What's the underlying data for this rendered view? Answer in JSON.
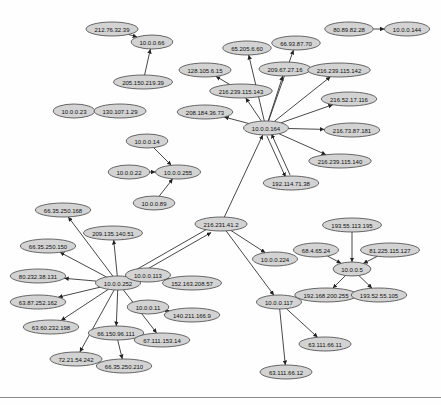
{
  "diagram": {
    "type": "directed-network-graph",
    "node_fill": "#d3d3d3",
    "node_stroke": "#444444",
    "edge_color": "#333333",
    "nodes": [
      {
        "id": "n1",
        "label": "212.76.32.39",
        "x": 112,
        "y": 29
      },
      {
        "id": "n2",
        "label": "10.0.0.66",
        "x": 152,
        "y": 42
      },
      {
        "id": "n3",
        "label": "205.150.219.39",
        "x": 143,
        "y": 82
      },
      {
        "id": "n4",
        "label": "10.0.0.23",
        "x": 74,
        "y": 111
      },
      {
        "id": "n5",
        "label": "130.107.1.29",
        "x": 120,
        "y": 111
      },
      {
        "id": "n6",
        "label": "80.89.82.28",
        "x": 349,
        "y": 29
      },
      {
        "id": "n7",
        "label": "10.0.0.144",
        "x": 407,
        "y": 29
      },
      {
        "id": "n8",
        "label": "65.205.6.60",
        "x": 247,
        "y": 48
      },
      {
        "id": "n9",
        "label": "66.93.87.70",
        "x": 296,
        "y": 43
      },
      {
        "id": "n10",
        "label": "128.105.6.15",
        "x": 205,
        "y": 70
      },
      {
        "id": "n11",
        "label": "209.67.27.16",
        "x": 285,
        "y": 69
      },
      {
        "id": "n12",
        "label": "216.239.115.142",
        "x": 339,
        "y": 70
      },
      {
        "id": "n13",
        "label": "216.239.115.143",
        "x": 241,
        "y": 91
      },
      {
        "id": "n14",
        "label": "216.52.17.116",
        "x": 349,
        "y": 99
      },
      {
        "id": "n15",
        "label": "208.184.36.73",
        "x": 205,
        "y": 112
      },
      {
        "id": "n16",
        "label": "10.0.0.164",
        "x": 266,
        "y": 128
      },
      {
        "id": "n17",
        "label": "216.73.87.181",
        "x": 352,
        "y": 130
      },
      {
        "id": "n18",
        "label": "216.239.115.140",
        "x": 340,
        "y": 161
      },
      {
        "id": "n19",
        "label": "192.114.71.38",
        "x": 291,
        "y": 183
      },
      {
        "id": "n20",
        "label": "10.0.0.14",
        "x": 147,
        "y": 141
      },
      {
        "id": "n21",
        "label": "10.0.0.22",
        "x": 129,
        "y": 172
      },
      {
        "id": "n22",
        "label": "10.0.0.255",
        "x": 178,
        "y": 172
      },
      {
        "id": "n23",
        "label": "10.0.0.89",
        "x": 154,
        "y": 203
      },
      {
        "id": "n24",
        "label": "216.231.41.2",
        "x": 221,
        "y": 224
      },
      {
        "id": "n25",
        "label": "10.0.0.224",
        "x": 275,
        "y": 259
      },
      {
        "id": "n26",
        "label": "66.35.250.168",
        "x": 63,
        "y": 210
      },
      {
        "id": "n27",
        "label": "209.135.140.51",
        "x": 113,
        "y": 233
      },
      {
        "id": "n28",
        "label": "66.35.250.150",
        "x": 48,
        "y": 246
      },
      {
        "id": "n29",
        "label": "10.0.0.252",
        "x": 118,
        "y": 283
      },
      {
        "id": "n30",
        "label": "80.232.38.131",
        "x": 38,
        "y": 276
      },
      {
        "id": "n31",
        "label": "63.87.252.162",
        "x": 38,
        "y": 302
      },
      {
        "id": "n32",
        "label": "63.60.232.198",
        "x": 51,
        "y": 327
      },
      {
        "id": "n33",
        "label": "66.150.96.111",
        "x": 116,
        "y": 333
      },
      {
        "id": "n34",
        "label": "67.111.153.14",
        "x": 162,
        "y": 340
      },
      {
        "id": "n35",
        "label": "72.21.54.242",
        "x": 76,
        "y": 359
      },
      {
        "id": "n36",
        "label": "66.35.250.210",
        "x": 124,
        "y": 366
      },
      {
        "id": "n37",
        "label": "10.0.0.113",
        "x": 148,
        "y": 275
      },
      {
        "id": "n38",
        "label": "152.163.208.57",
        "x": 192,
        "y": 283
      },
      {
        "id": "n39",
        "label": "10.0.0.11",
        "x": 148,
        "y": 307
      },
      {
        "id": "n40",
        "label": "140.211.166.9",
        "x": 192,
        "y": 315
      },
      {
        "id": "n41",
        "label": "10.0.0.117",
        "x": 279,
        "y": 302
      },
      {
        "id": "n42",
        "label": "63.111.66.11",
        "x": 325,
        "y": 344
      },
      {
        "id": "n43",
        "label": "63.111.66.12",
        "x": 286,
        "y": 372
      },
      {
        "id": "n44",
        "label": "193.55.113.195",
        "x": 352,
        "y": 225
      },
      {
        "id": "n45",
        "label": "68.4.65.24",
        "x": 316,
        "y": 250
      },
      {
        "id": "n46",
        "label": "81.225.115.127",
        "x": 390,
        "y": 250
      },
      {
        "id": "n47",
        "label": "10.0.0.5",
        "x": 352,
        "y": 269
      },
      {
        "id": "n48",
        "label": "192.168.200.255",
        "x": 326,
        "y": 295
      },
      {
        "id": "n49",
        "label": "193.52.55.105",
        "x": 379,
        "y": 295
      }
    ],
    "edges": [
      {
        "from": "n1",
        "to": "n2"
      },
      {
        "from": "n3",
        "to": "n2"
      },
      {
        "from": "n4",
        "to": "n5"
      },
      {
        "from": "n6",
        "to": "n7"
      },
      {
        "from": "n16",
        "to": "n8"
      },
      {
        "from": "n16",
        "to": "n9"
      },
      {
        "from": "n13",
        "to": "n10"
      },
      {
        "from": "n16",
        "to": "n11"
      },
      {
        "from": "n16",
        "to": "n12"
      },
      {
        "from": "n16",
        "to": "n13"
      },
      {
        "from": "n16",
        "to": "n14"
      },
      {
        "from": "n16",
        "to": "n15"
      },
      {
        "from": "n16",
        "to": "n17"
      },
      {
        "from": "n16",
        "to": "n18"
      },
      {
        "from": "n16",
        "to": "n19"
      },
      {
        "from": "n19",
        "to": "n16"
      },
      {
        "from": "n24",
        "to": "n16"
      },
      {
        "from": "n20",
        "to": "n22"
      },
      {
        "from": "n21",
        "to": "n22"
      },
      {
        "from": "n23",
        "to": "n22"
      },
      {
        "from": "n24",
        "to": "n25"
      },
      {
        "from": "n24",
        "to": "n41"
      },
      {
        "from": "n29",
        "to": "n24"
      },
      {
        "from": "n24",
        "to": "n29"
      },
      {
        "from": "n29",
        "to": "n26"
      },
      {
        "from": "n29",
        "to": "n27"
      },
      {
        "from": "n29",
        "to": "n28"
      },
      {
        "from": "n29",
        "to": "n30"
      },
      {
        "from": "n29",
        "to": "n31"
      },
      {
        "from": "n29",
        "to": "n32"
      },
      {
        "from": "n29",
        "to": "n33"
      },
      {
        "from": "n29",
        "to": "n34"
      },
      {
        "from": "n29",
        "to": "n35"
      },
      {
        "from": "n33",
        "to": "n36"
      },
      {
        "from": "n37",
        "to": "n38"
      },
      {
        "from": "n39",
        "to": "n40"
      },
      {
        "from": "n41",
        "to": "n42"
      },
      {
        "from": "n41",
        "to": "n43"
      },
      {
        "from": "n44",
        "to": "n47"
      },
      {
        "from": "n45",
        "to": "n47"
      },
      {
        "from": "n46",
        "to": "n47"
      },
      {
        "from": "n47",
        "to": "n48"
      },
      {
        "from": "n47",
        "to": "n49"
      }
    ]
  }
}
